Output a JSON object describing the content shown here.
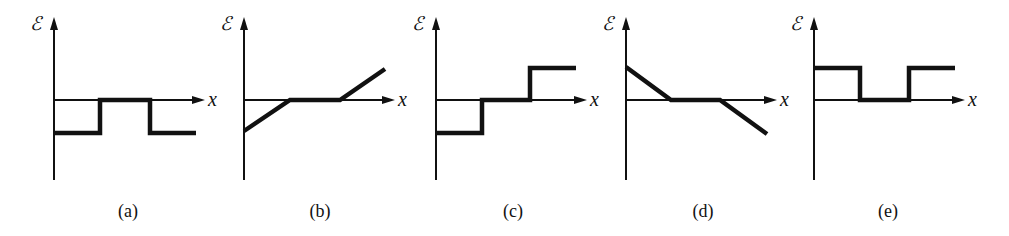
{
  "figure": {
    "axis_labels": {
      "y": "ℰ",
      "x": "x"
    },
    "panels": [
      {
        "id": "a",
        "label": "(a)",
        "origin_x": 54,
        "label_x": 128,
        "description": "negative constant, zero in middle, negative constant",
        "points": [
          [
            54,
            133
          ],
          [
            100,
            133
          ],
          [
            100,
            100
          ],
          [
            150,
            100
          ],
          [
            150,
            133
          ],
          [
            196,
            133
          ]
        ]
      },
      {
        "id": "b",
        "label": "(b)",
        "origin_x": 244,
        "label_x": 320,
        "description": "rising linear from negative to zero, zero in middle, rising linear positive",
        "points": [
          [
            244,
            131
          ],
          [
            290,
            100
          ],
          [
            340,
            100
          ],
          [
            385,
            69
          ]
        ]
      },
      {
        "id": "c",
        "label": "(c)",
        "origin_x": 436,
        "label_x": 513,
        "description": "negative constant, zero in middle, positive constant",
        "points": [
          [
            436,
            133
          ],
          [
            482,
            133
          ],
          [
            482,
            100
          ],
          [
            530,
            100
          ],
          [
            530,
            68
          ],
          [
            576,
            68
          ]
        ]
      },
      {
        "id": "d",
        "label": "(d)",
        "origin_x": 626,
        "label_x": 703,
        "description": "falling linear from positive to zero, zero in middle, falling linear negative",
        "points": [
          [
            626,
            67
          ],
          [
            671,
            100
          ],
          [
            720,
            100
          ],
          [
            767,
            134
          ]
        ]
      },
      {
        "id": "e",
        "label": "(e)",
        "origin_x": 814,
        "label_x": 888,
        "description": "positive constant, zero in middle, positive constant",
        "points": [
          [
            814,
            68
          ],
          [
            860,
            68
          ],
          [
            860,
            100
          ],
          [
            909,
            100
          ],
          [
            909,
            68
          ],
          [
            955,
            68
          ]
        ]
      }
    ]
  },
  "chart_data": [
    {
      "type": "line",
      "title": "(a)",
      "xlabel": "x",
      "ylabel": "ℰ",
      "x": [
        0,
        1,
        1,
        2,
        2,
        3
      ],
      "values": [
        -1,
        -1,
        0,
        0,
        -1,
        -1
      ]
    },
    {
      "type": "line",
      "title": "(b)",
      "xlabel": "x",
      "ylabel": "ℰ",
      "x": [
        0,
        1,
        2,
        3
      ],
      "values": [
        -1,
        0,
        0,
        1
      ]
    },
    {
      "type": "line",
      "title": "(c)",
      "xlabel": "x",
      "ylabel": "ℰ",
      "x": [
        0,
        1,
        1,
        2,
        2,
        3
      ],
      "values": [
        -1,
        -1,
        0,
        0,
        1,
        1
      ]
    },
    {
      "type": "line",
      "title": "(d)",
      "xlabel": "x",
      "ylabel": "ℰ",
      "x": [
        0,
        1,
        2,
        3
      ],
      "values": [
        1,
        0,
        0,
        -1
      ]
    },
    {
      "type": "line",
      "title": "(e)",
      "xlabel": "x",
      "ylabel": "ℰ",
      "x": [
        0,
        1,
        1,
        2,
        2,
        3
      ],
      "values": [
        1,
        1,
        0,
        0,
        1,
        1
      ]
    }
  ]
}
